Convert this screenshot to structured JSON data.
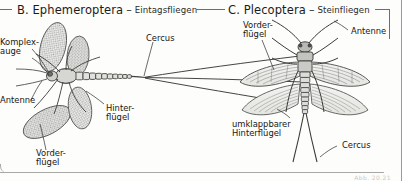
{
  "page": {
    "width": 402,
    "height": 181,
    "background": "#fdfdfb",
    "ink": "#1b1b1b",
    "rule_color": "#6e6e6a"
  },
  "sections": [
    {
      "id": "ephemeroptera",
      "letter": "B.",
      "order_name": "Ephemeroptera",
      "title": "B. Ephemeroptera",
      "dash": "–",
      "common_name": "Eintagsfliegen",
      "figure": "mayfly-lateral-view",
      "labels": [
        {
          "key": "komplexauge",
          "text_line1": "Komplex-",
          "text_line2": "auge"
        },
        {
          "key": "antenne",
          "text_line1": "Antenne",
          "text_line2": ""
        },
        {
          "key": "vorderfluegel",
          "text_line1": "Vorder-",
          "text_line2": "flügel"
        },
        {
          "key": "hinterfluegel",
          "text_line1": "Hinter-",
          "text_line2": "flügel"
        },
        {
          "key": "cercus",
          "text_line1": "Cercus",
          "text_line2": ""
        }
      ]
    },
    {
      "id": "plecoptera",
      "letter": "C.",
      "order_name": "Plecoptera",
      "title": "C. Plecoptera",
      "dash": "–",
      "common_name": "Steinfliegen",
      "figure": "stonefly-dorsal-view",
      "labels": [
        {
          "key": "vorderfluegel",
          "text_line1": "Vorder-",
          "text_line2": "flügel"
        },
        {
          "key": "antenne",
          "text_line1": "Antenne",
          "text_line2": ""
        },
        {
          "key": "umklappbarer-hinterfluegel",
          "text_line1": "umklappbarer",
          "text_line2": "Hinterflügel"
        },
        {
          "key": "cercus",
          "text_line1": "Cercus",
          "text_line2": ""
        }
      ]
    }
  ],
  "footer": {
    "caption_faint": "Abb. 20.21"
  }
}
